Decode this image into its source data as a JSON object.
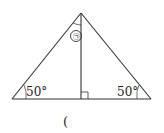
{
  "diagram": {
    "type": "isosceles-triangle-with-altitude",
    "marked_angle_label": "㉠",
    "left_base_angle": "50°",
    "right_base_angle": "50°",
    "answer_paren": "("
  }
}
